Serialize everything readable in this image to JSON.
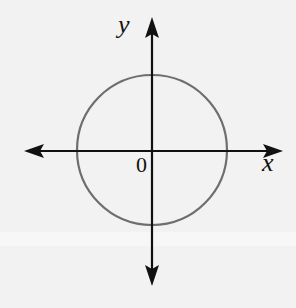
{
  "figure": {
    "x_axis_label": "x",
    "y_axis_label": "y",
    "origin_label": "0",
    "shape": "circle centered at origin",
    "colors": {
      "axes": "#111111",
      "circle": "#6e6e6e",
      "background": "#f2f2f2"
    }
  }
}
